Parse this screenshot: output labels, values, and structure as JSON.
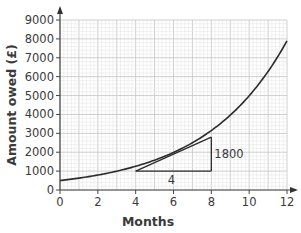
{
  "chart_data": {
    "type": "line",
    "title": "",
    "xlabel": "Months",
    "ylabel": "Amount owed (£)",
    "xlim": [
      0,
      12
    ],
    "ylim": [
      0,
      9000
    ],
    "grid": true,
    "x_ticks": [
      0,
      2,
      4,
      6,
      8,
      10,
      12
    ],
    "y_ticks": [
      0,
      1000,
      2000,
      3000,
      4000,
      5000,
      6000,
      7000,
      8000,
      9000
    ],
    "series": [
      {
        "name": "Amount owed",
        "x": [
          0,
          1,
          2,
          3,
          4,
          5,
          6,
          7,
          8,
          9,
          10,
          11,
          12
        ],
        "values": [
          500,
          630,
          790,
          1000,
          1260,
          1590,
          2000,
          2520,
          3180,
          4000,
          5040,
          6350,
          7900
        ]
      },
      {
        "name": "Tangent at 6 months",
        "x": [
          4,
          8
        ],
        "values": [
          1000,
          2800
        ]
      }
    ],
    "annotations": [
      {
        "text": "1800",
        "type": "rise",
        "x": 8,
        "y_from": 1000,
        "y_to": 2800
      },
      {
        "text": "4",
        "type": "run",
        "x_from": 4,
        "x_to": 8,
        "y": 1000
      }
    ]
  },
  "labels": {
    "xlabel": "Months",
    "ylabel": "Amount owed (£)",
    "rise": "1800",
    "run": "4"
  }
}
